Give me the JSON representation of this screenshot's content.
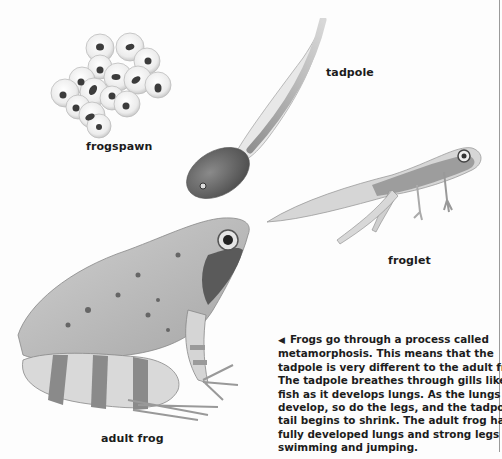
{
  "labels": {
    "frogspawn": "frogspawn",
    "tadpole": "tadpole",
    "froglet": "froglet",
    "adult_frog": "adult frog"
  },
  "caption": {
    "pointer_icon": "◀",
    "lines": [
      "Frogs go through a process called",
      "metamorphosis. This means that the",
      "tadpole is very different to the adult frog.",
      "The tadpole breathes through gills like a",
      "fish as it develops lungs. As the lungs",
      "develop, so do the legs, and the tadpole's",
      "tail begins to shrink. The adult frog has",
      "fully developed lungs and strong legs for",
      "swimming and jumping."
    ]
  },
  "illustrations": [
    {
      "name": "frogspawn",
      "description": "cluster of frog eggs"
    },
    {
      "name": "tadpole",
      "description": "tadpole with long tail"
    },
    {
      "name": "froglet",
      "description": "froglet with legs and shrinking tail"
    },
    {
      "name": "adult-frog",
      "description": "adult frog sitting"
    }
  ]
}
